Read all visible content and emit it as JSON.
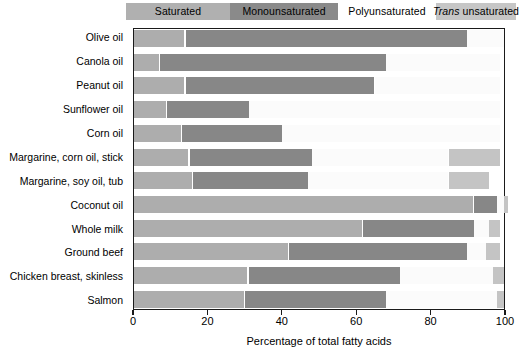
{
  "legend": {
    "items": [
      {
        "key": "saturated",
        "label": "Saturated",
        "color": "#b0b0b0",
        "italic_prefix": ""
      },
      {
        "key": "monounsaturated",
        "label": "Monounsaturated",
        "color": "#8a8a8a",
        "italic_prefix": ""
      },
      {
        "key": "polyunsaturated",
        "label": "Polyunsaturated",
        "color": "#ffffff",
        "italic_prefix": ""
      },
      {
        "key": "trans",
        "label": "unsaturated",
        "color": "#c6c6c6",
        "italic_prefix": "Trans"
      }
    ]
  },
  "axis": {
    "x_title": "Percentage of total fatty acids",
    "x_ticks": [
      "0",
      "20",
      "40",
      "60",
      "80",
      "100"
    ],
    "x_min": 0,
    "x_max": 100
  },
  "colors": {
    "saturated": "#adadad",
    "monounsaturated": "#878787",
    "polyunsaturated": "#fbfbfb",
    "trans": "#c4c4c4",
    "frame": "#1a1a1a",
    "background": "#ffffff"
  },
  "chart_data": {
    "type": "bar",
    "orientation": "horizontal",
    "stacked": true,
    "title": "",
    "xlabel": "Percentage of total fatty acids",
    "ylabel": "",
    "xlim": [
      0,
      100
    ],
    "grid": false,
    "legend_position": "top",
    "categories": [
      "Olive oil",
      "Canola oil",
      "Peanut oil",
      "Sunflower oil",
      "Corn oil",
      "Margarine, corn oil, stick",
      "Margarine, soy oil, tub",
      "Coconut oil",
      "Whole milk",
      "Ground beef",
      "Chicken breast, skinless",
      "Salmon"
    ],
    "series": [
      {
        "name": "Saturated",
        "values": [
          14,
          7,
          14,
          9,
          13,
          15,
          16,
          92,
          62,
          42,
          31,
          30
        ]
      },
      {
        "name": "Monounsaturated",
        "values": [
          76,
          61,
          51,
          22,
          27,
          33,
          31,
          6,
          30,
          48,
          41,
          38
        ]
      },
      {
        "name": "Polyunsaturated",
        "values": [
          10,
          31,
          34,
          68,
          59,
          37,
          38,
          2,
          4,
          5,
          25,
          30
        ]
      },
      {
        "name": "Trans unsaturated",
        "values": [
          0,
          0,
          0,
          0,
          0,
          14,
          11,
          1,
          3,
          4,
          3,
          2
        ]
      }
    ]
  }
}
